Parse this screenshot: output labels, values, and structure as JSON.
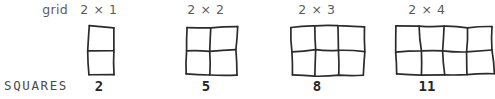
{
  "worksheet": {
    "row_labels": {
      "grid": "grid",
      "squares": "SQUARES"
    },
    "stroke_color": "#2b2b2b",
    "label_color": "#5b5b5b",
    "value_color": "#262626"
  },
  "chart_data": {
    "type": "table",
    "title": "",
    "categories": [
      "2 × 1",
      "2 × 2",
      "2 × 3",
      "2 × 4"
    ],
    "values": [
      2,
      5,
      8,
      11
    ],
    "xlabel": "grid",
    "ylabel": "SQUARES",
    "series": [
      {
        "name": "SQUARES",
        "values": [
          2,
          5,
          8,
          11
        ]
      }
    ],
    "grid": false,
    "legend": "none"
  },
  "columns": [
    {
      "header": "2 × 1",
      "count": "2",
      "cols": 1,
      "rows": 2,
      "x": 85,
      "label_x": 78,
      "label_w": 42,
      "count_x": 78,
      "count_w": 42
    },
    {
      "header": "2 × 2",
      "count": "5",
      "cols": 2,
      "rows": 2,
      "x": 184,
      "label_x": 181,
      "label_w": 50,
      "count_x": 181,
      "count_w": 50
    },
    {
      "header": "2 × 3",
      "count": "8",
      "cols": 3,
      "rows": 2,
      "x": 288,
      "label_x": 292,
      "label_w": 50,
      "count_x": 292,
      "count_w": 50
    },
    {
      "header": "2 × 4",
      "count": "11",
      "cols": 4,
      "rows": 2,
      "x": 393,
      "label_x": 400,
      "label_w": 54,
      "count_x": 400,
      "count_w": 54
    }
  ],
  "grid_label": {
    "x": 22,
    "w": 46
  }
}
